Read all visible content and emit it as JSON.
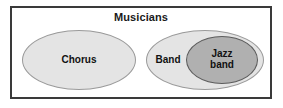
{
  "diagram": {
    "type": "euler-venn",
    "universe": {
      "title": "Musicians",
      "border_color": "#3a3a3a",
      "fill_color": "#ffffff"
    },
    "sets": [
      {
        "id": "chorus",
        "label": "Chorus",
        "fill_color": "#e4e4e4",
        "stroke_color": "#9a9a9a",
        "relation": "disjoint-from-band"
      },
      {
        "id": "band",
        "label": "Band",
        "fill_color": "#e4e4e4",
        "stroke_color": "#9a9a9a",
        "relation": "contains-jazz-band"
      },
      {
        "id": "jazz_band",
        "label_line_1": "Jazz",
        "label_line_2": "band",
        "fill_color": "#b0b0b0",
        "stroke_color": "#5c5c5c",
        "relation": "subset-of-band"
      }
    ]
  }
}
